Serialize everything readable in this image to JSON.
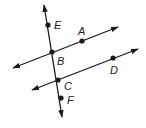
{
  "diagram": {
    "type": "geometry-parallel-lines-transversal",
    "colors": {
      "stroke": "#1a1a1a",
      "label": "#222222",
      "background": "#ffffff"
    },
    "lines": [
      {
        "id": "transversal",
        "through": [
          "E",
          "B",
          "C",
          "F"
        ],
        "x1": 44,
        "y1": 5,
        "x2": 62,
        "y2": 117,
        "arrows": "both"
      },
      {
        "id": "line-BA",
        "through": [
          "B",
          "A"
        ],
        "x1": 13,
        "y1": 68,
        "x2": 118,
        "y2": 27,
        "arrows": "both"
      },
      {
        "id": "line-CD",
        "through": [
          "C",
          "D"
        ],
        "x1": 32,
        "y1": 90,
        "x2": 138,
        "y2": 49,
        "arrows": "both"
      }
    ],
    "points": [
      {
        "name": "E",
        "x": 48,
        "y": 25,
        "label": "E",
        "lx": 54,
        "ly": 29
      },
      {
        "name": "A",
        "x": 82,
        "y": 41,
        "label": "A",
        "lx": 78,
        "ly": 35
      },
      {
        "name": "B",
        "x": 52,
        "y": 52,
        "label": "B",
        "lx": 57,
        "ly": 65
      },
      {
        "name": "D",
        "x": 113,
        "y": 58,
        "label": "D",
        "lx": 110,
        "ly": 74
      },
      {
        "name": "C",
        "x": 58,
        "y": 80,
        "label": "C",
        "lx": 64,
        "ly": 90
      },
      {
        "name": "F",
        "x": 61,
        "y": 98,
        "label": "F",
        "lx": 67,
        "ly": 104
      }
    ]
  }
}
